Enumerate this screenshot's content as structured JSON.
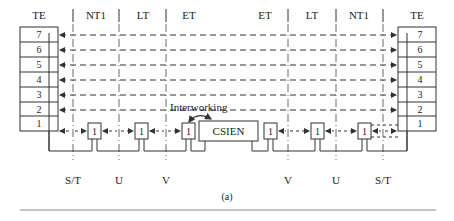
{
  "diagram": {
    "caption": "(a)",
    "colors": {
      "line": "#333333",
      "text": "#222222",
      "rule": "#888888"
    },
    "header_labels": [
      {
        "id": "te-left",
        "label": "TE",
        "x": 39
      },
      {
        "id": "nt1-left",
        "label": "NT1",
        "x": 96
      },
      {
        "id": "lt-left",
        "label": "LT",
        "x": 143
      },
      {
        "id": "et-left",
        "label": "ET",
        "x": 189
      },
      {
        "id": "et-right",
        "label": "ET",
        "x": 265
      },
      {
        "id": "lt-right",
        "label": "LT",
        "x": 312
      },
      {
        "id": "nt1-right",
        "label": "NT1",
        "x": 359
      },
      {
        "id": "te-right",
        "label": "TE",
        "x": 417
      }
    ],
    "layers_left": [
      "7",
      "6",
      "5",
      "4",
      "3",
      "2",
      "1"
    ],
    "layers_right": [
      "7",
      "6",
      "5",
      "4",
      "3",
      "2",
      "1"
    ],
    "reference_points": [
      {
        "label": "S/T",
        "x": 73
      },
      {
        "label": "U",
        "x": 119
      },
      {
        "label": "V",
        "x": 166
      },
      {
        "label": "V",
        "x": 288
      },
      {
        "label": "U",
        "x": 336
      },
      {
        "label": "S/T",
        "x": 383
      }
    ],
    "relay_boxes": [
      {
        "label": "1",
        "x": 88
      },
      {
        "label": "1",
        "x": 135
      },
      {
        "label": "1",
        "x": 182
      },
      {
        "label": "1",
        "x": 264
      },
      {
        "label": "1",
        "x": 311
      },
      {
        "label": "1",
        "x": 358
      }
    ],
    "central_node": {
      "label": "CSIEN"
    },
    "interworking_label": "Interworking"
  }
}
